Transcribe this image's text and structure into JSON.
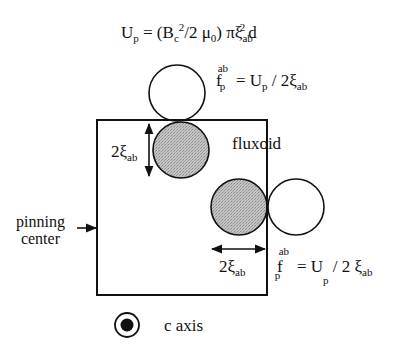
{
  "diagram": {
    "title_equation": {
      "lhs": "U",
      "lhs_sub": "p",
      "eq": " = (B",
      "bc_sub": "c",
      "bc_sup": "2",
      "mid": "/2 μ",
      "mu_sub": "0",
      "rest": ") πξ",
      "xi_sub": "ab",
      "xi_sup": "2",
      "end": "d"
    },
    "top_force_equation": {
      "f": "f",
      "f_sup": "ab",
      "f_sub": "p",
      "eq": " = U",
      "u_sub": "p",
      "rest": " / 2ξ",
      "xi_sub": "ab"
    },
    "bottom_force_equation": {
      "f": "f",
      "f_sup": "ab",
      "f_sub": "p",
      "eq": " = U",
      "u_sub": "p",
      "rest": " / 2 ξ",
      "xi_sub": "ab"
    },
    "labels": {
      "fluxoid": "fluxoid",
      "pinning_center_line1": "pinning",
      "pinning_center_line2": "center",
      "vertical_dimension": "2ξ",
      "vertical_dimension_sub": "ab",
      "horizontal_dimension": "2ξ",
      "horizontal_dimension_sub": "ab",
      "c_axis": "c axis"
    },
    "colors": {
      "stroke": "#111111",
      "fluxoid_fill": "#b8b8b8",
      "empty_fill": "#ffffff"
    },
    "shapes": {
      "pinning_box": {
        "x": 97,
        "y": 120,
        "w": 170,
        "h": 175
      },
      "circles": [
        {
          "name": "top-outside-fluxoid",
          "cx": 177,
          "cy": 93,
          "r": 28,
          "filled": false
        },
        {
          "name": "top-pinned-fluxoid",
          "cx": 181,
          "cy": 150,
          "r": 28,
          "filled": true
        },
        {
          "name": "right-pinned-fluxoid",
          "cx": 239,
          "cy": 207,
          "r": 28,
          "filled": true
        },
        {
          "name": "right-outside-fluxoid",
          "cx": 296,
          "cy": 207,
          "r": 28,
          "filled": false
        }
      ]
    }
  }
}
